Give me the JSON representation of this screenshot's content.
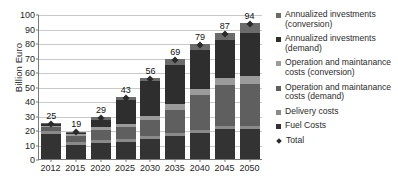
{
  "chart_data": {
    "type": "bar",
    "stacked": true,
    "title": "",
    "xlabel": "",
    "ylabel": "Billion Euro",
    "ylim": [
      0,
      100
    ],
    "ytick_step": 10,
    "yticks": [
      0,
      10,
      20,
      30,
      40,
      50,
      60,
      70,
      80,
      90,
      100
    ],
    "grid": true,
    "legend_position": "right",
    "categories": [
      "2012",
      "2015",
      "2020",
      "2025",
      "2030",
      "2035",
      "2040",
      "2045",
      "2050"
    ],
    "series": [
      {
        "name": "Fuel Costs",
        "color": "#333333",
        "values": [
          17,
          10,
          11,
          12,
          14,
          16,
          18,
          21,
          21
        ]
      },
      {
        "name": "Delivery costs",
        "color": "#8a8a8a",
        "values": [
          2,
          2,
          2,
          2,
          2,
          2,
          2,
          2,
          2
        ]
      },
      {
        "name": "Operation and maintanance costs (demand)",
        "color": "#5f5f5f",
        "values": [
          3,
          4,
          7,
          8,
          11,
          16,
          24,
          28,
          29
        ]
      },
      {
        "name": "Operation and maintanance costs (conversion)",
        "color": "#9b9b9b",
        "values": [
          1,
          1,
          2,
          2,
          3,
          4,
          4,
          5,
          5
        ]
      },
      {
        "name": "Annualized investments (demand)",
        "color": "#2e2e2e",
        "values": [
          1,
          1,
          5,
          17,
          24,
          27,
          27,
          26,
          30
        ]
      },
      {
        "name": "Annualized investments (conversion)",
        "color": "#6b6b6b",
        "values": [
          1,
          1,
          2,
          2,
          2,
          4,
          4,
          5,
          7
        ]
      }
    ],
    "totals": [
      25,
      19,
      29,
      43,
      56,
      69,
      79,
      87,
      94
    ],
    "total_marker": {
      "name": "Total",
      "color": "#2a2a2a",
      "shape": "diamond"
    }
  },
  "legend": {
    "items": [
      {
        "label": "Annualized investments (conversion)",
        "color": "#6b6b6b",
        "shape": "square"
      },
      {
        "label": "Annualized investments (demand)",
        "color": "#2e2e2e",
        "shape": "square"
      },
      {
        "label": "Operation and maintanance costs (conversion)",
        "color": "#9b9b9b",
        "shape": "square"
      },
      {
        "label": "Operation and maintanance costs (demand)",
        "color": "#5f5f5f",
        "shape": "square"
      },
      {
        "label": "Delivery costs",
        "color": "#8a8a8a",
        "shape": "square"
      },
      {
        "label": "Fuel Costs",
        "color": "#333333",
        "shape": "square"
      },
      {
        "label": "Total",
        "color": "#2a2a2a",
        "shape": "diamond"
      }
    ]
  }
}
